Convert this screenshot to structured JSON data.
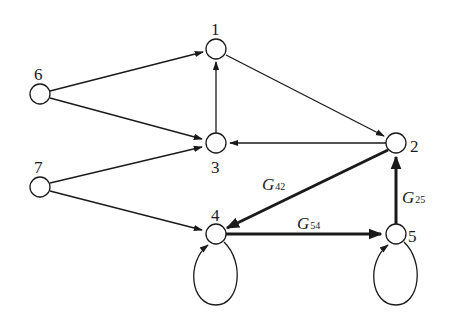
{
  "diagram": {
    "type": "signal-flow-graph",
    "nodes": [
      {
        "id": "1",
        "label": "1",
        "x": 216,
        "y": 49
      },
      {
        "id": "2",
        "label": "2",
        "x": 396,
        "y": 143
      },
      {
        "id": "3",
        "label": "3",
        "x": 216,
        "y": 143
      },
      {
        "id": "4",
        "label": "4",
        "x": 216,
        "y": 234
      },
      {
        "id": "5",
        "label": "5",
        "x": 396,
        "y": 234
      },
      {
        "id": "6",
        "label": "6",
        "x": 40,
        "y": 94
      },
      {
        "id": "7",
        "label": "7",
        "x": 40,
        "y": 187
      }
    ],
    "edges": [
      {
        "from": "6",
        "to": "1",
        "bold": false,
        "label": ""
      },
      {
        "from": "6",
        "to": "3",
        "bold": false,
        "label": ""
      },
      {
        "from": "7",
        "to": "3",
        "bold": false,
        "label": ""
      },
      {
        "from": "7",
        "to": "4",
        "bold": false,
        "label": ""
      },
      {
        "from": "3",
        "to": "1",
        "bold": false,
        "label": ""
      },
      {
        "from": "1",
        "to": "2",
        "bold": false,
        "label": ""
      },
      {
        "from": "2",
        "to": "3",
        "bold": false,
        "label": ""
      },
      {
        "from": "2",
        "to": "4",
        "bold": true,
        "label": "G42"
      },
      {
        "from": "4",
        "to": "5",
        "bold": true,
        "label": "G54"
      },
      {
        "from": "5",
        "to": "2",
        "bold": true,
        "label": "G25"
      },
      {
        "from": "4",
        "to": "4",
        "bold": false,
        "label": "",
        "self_loop": true
      },
      {
        "from": "5",
        "to": "5",
        "bold": false,
        "label": "",
        "self_loop": true
      }
    ],
    "edge_labels": {
      "g42": {
        "main": "G",
        "sub": "42"
      },
      "g54": {
        "main": "G",
        "sub": "54"
      },
      "g25": {
        "main": "G",
        "sub": "25"
      }
    }
  }
}
